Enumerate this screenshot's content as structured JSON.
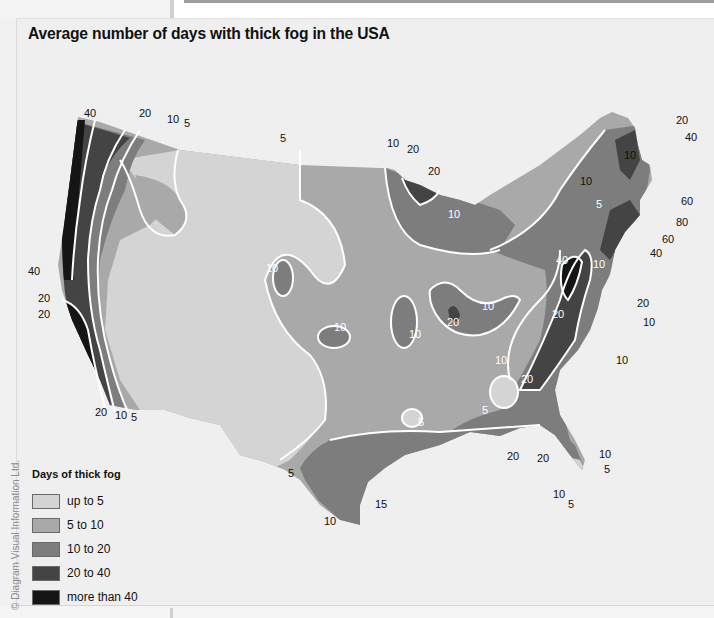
{
  "title": "Average number of days with thick fog in the USA",
  "copyright": "© Diagram Visual Information Ltd.",
  "legend": {
    "title": "Days of thick fog",
    "items": [
      {
        "label": "up to 5",
        "color": "#d4d4d4"
      },
      {
        "label": "5 to 10",
        "color": "#a9a9a9"
      },
      {
        "label": "10 to 20",
        "color": "#7d7d7d"
      },
      {
        "label": "20 to 40",
        "color": "#444444"
      },
      {
        "label": "more than 40",
        "color": "#151515"
      }
    ]
  },
  "colors": {
    "background": "#efefef",
    "contour_line": "#ffffff",
    "state_border": "#e6e6e6"
  },
  "map_labels": {
    "pnw_40": "40",
    "pnw_20": "20",
    "pnw_10": "10",
    "pnw_5": "5",
    "mont_5": "5",
    "superior_10": "10",
    "superior_20a": "20",
    "superior_20b": "20",
    "wisc_10": "10",
    "wy_10": "10",
    "ks_10": "10",
    "mo_10": "10",
    "il_20": "20",
    "oh_10": "10",
    "ny_10": "10",
    "ny_5": "5",
    "me_10": "10",
    "me_20": "20",
    "me_40": "40",
    "ne_60a": "60",
    "ne_80": "80",
    "ne_60b": "60",
    "ne_40": "40",
    "app_40": "40",
    "app_10": "10",
    "app_20": "20",
    "va_20": "20",
    "va_10": "10",
    "nc_10": "10",
    "al_10": "10",
    "al_20": "20",
    "al_5": "5",
    "ar_5": "5",
    "ca_40": "40",
    "ca_20a": "20",
    "ca_20b": "20",
    "socal_20": "20",
    "socal_10": "10",
    "socal_5": "5",
    "tx_5": "5",
    "tx_10": "10",
    "tx_15": "15",
    "gulf_20a": "20",
    "gulf_20b": "20",
    "fl_10a": "10",
    "fl_5a": "5",
    "fl_10b": "10",
    "fl_5b": "5"
  }
}
